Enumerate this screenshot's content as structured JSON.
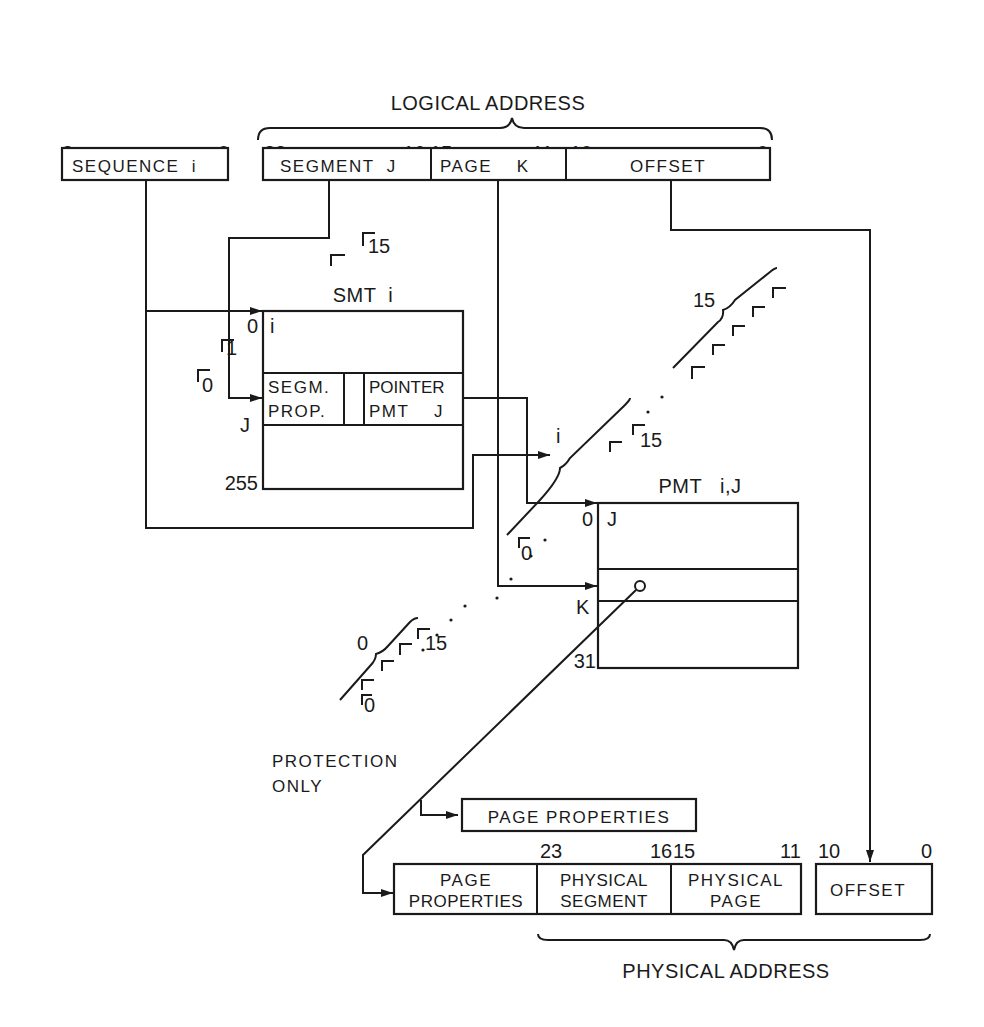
{
  "logical_address": {
    "title": "LOGICAL ADDRESS",
    "sequence": {
      "label": "SEQUENCE  i",
      "bit_high": "3",
      "bit_low": "0"
    },
    "segment": {
      "label": "SEGMENT  J",
      "bit_high": "23",
      "bit_low": "16"
    },
    "page": {
      "label": "PAGE    K",
      "bit_high": "15",
      "bit_low": "11"
    },
    "offset": {
      "label": "OFFSET",
      "bit_high": "10",
      "bit_low": "0"
    }
  },
  "smt": {
    "title": "SMT  i",
    "row0_index": "0",
    "row0_content": "i",
    "rowJ_index": "J",
    "last_index": "255",
    "segm_prop": [
      "SEGM.",
      "PROP."
    ],
    "pointer": [
      "POINTER",
      "PMT    J"
    ],
    "stack_marks": {
      "m0": "0",
      "m1": "1",
      "m15": "15"
    }
  },
  "pmt": {
    "title": "PMT   i,J",
    "row0_index": "0",
    "row0_content": "J",
    "rowK_index": "K",
    "last_index": "31",
    "group_i_label": "i",
    "group_i_mark_0": "0",
    "group_i_mark_15": "15",
    "group_top_label": "15",
    "group_bottom_label": "0",
    "group_bottom_mark_0": "0",
    "group_bottom_mark_15": "15"
  },
  "protection": {
    "line1": "PROTECTION",
    "line2": "ONLY"
  },
  "page_properties_box": "PAGE PROPERTIES",
  "physical_address": {
    "title": "PHYSICAL ADDRESS",
    "page_properties": [
      "PAGE",
      "PROPERTIES"
    ],
    "segment": {
      "label": [
        "PHYSICAL",
        "SEGMENT"
      ],
      "bit_high": "23",
      "bit_low": "16"
    },
    "page": {
      "label": [
        "PHYSICAL",
        "PAGE"
      ],
      "bit_high": "15",
      "bit_low": "11"
    },
    "offset": {
      "label": "OFFSET",
      "bit_high": "10",
      "bit_low": "0"
    }
  }
}
